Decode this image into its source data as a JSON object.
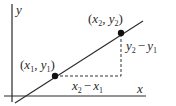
{
  "diagram": {
    "axes": {
      "x_label": "x",
      "y_label": "y"
    },
    "points": [
      {
        "label": "(x1, y1)",
        "var_x": "x",
        "sub_x": "1",
        "var_y": "y",
        "sub_y": "1"
      },
      {
        "label": "(x2, y2)",
        "var_x": "x",
        "sub_x": "2",
        "var_y": "y",
        "sub_y": "2"
      }
    ],
    "run": {
      "label": "x2 − x1",
      "a": "x",
      "a_sub": "2",
      "op": "−",
      "b": "x",
      "b_sub": "1"
    },
    "rise": {
      "label": "y2 − y1",
      "a": "y",
      "a_sub": "2",
      "op": "−",
      "b": "y",
      "b_sub": "1"
    },
    "colors": {
      "line": "#2a2a2a",
      "point": "#111111",
      "dash": "#333333"
    }
  }
}
